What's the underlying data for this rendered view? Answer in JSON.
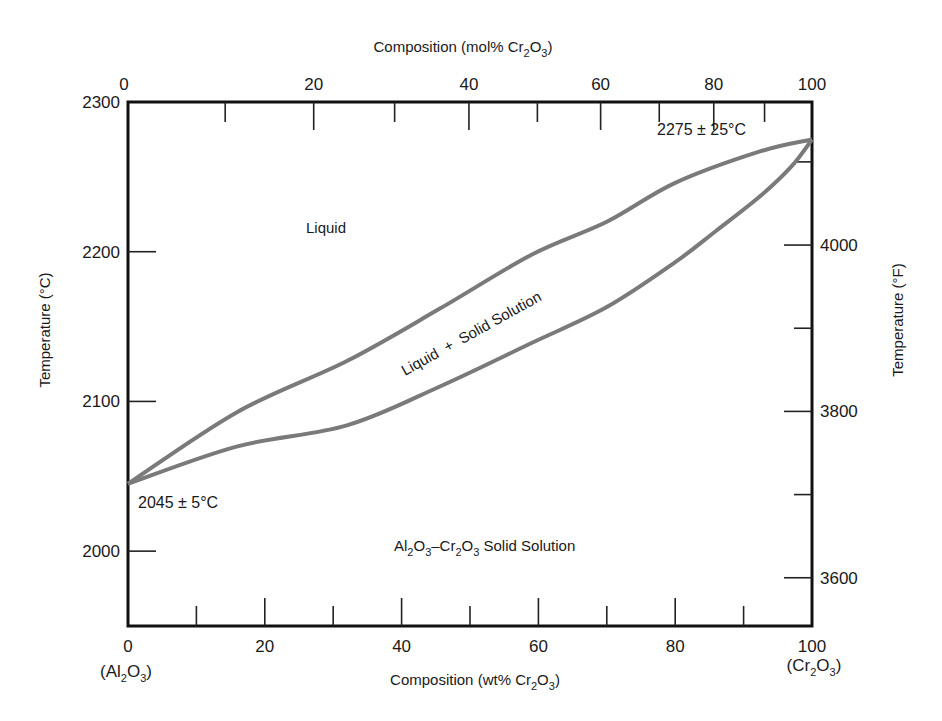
{
  "chart_data": {
    "type": "line",
    "title": "",
    "xlabel": "Composition (wt% Cr2O3)",
    "xlabel_parts": {
      "pre": "Composition (wt% Cr",
      "sub1": "2",
      "mid": "O",
      "sub2": "3",
      "post": ")"
    },
    "x2label": "Composition (mol% Cr2O3)",
    "x2label_parts": {
      "pre": "Composition (mol% Cr",
      "sub1": "2",
      "mid": "O",
      "sub2": "3",
      "post": ")"
    },
    "ylabel": "Temperature (°C)",
    "y2label": "Temperature (°F)",
    "xlim": [
      0,
      100
    ],
    "ylim": [
      1950,
      2300
    ],
    "grid": false,
    "x_ticks": {
      "major": [
        0,
        20,
        40,
        60,
        80,
        100
      ],
      "minor": [
        10,
        30,
        50,
        70,
        90
      ]
    },
    "x_tick_labels": [
      "0",
      "20",
      "40",
      "60",
      "80",
      "100"
    ],
    "x2_ticks_mol": {
      "major": [
        0,
        20,
        40,
        60,
        80,
        100
      ],
      "minor": [
        10,
        30,
        50,
        70,
        90
      ]
    },
    "x2_tick_labels": [
      "0",
      "20",
      "40",
      "60",
      "80",
      "100"
    ],
    "y_ticks": [
      2000,
      2100,
      2200,
      2300
    ],
    "y_tick_labels": [
      "2000",
      "2100",
      "2200",
      "2300"
    ],
    "y2_ticks_F": {
      "major": [
        3600,
        3800,
        4000
      ],
      "minor": [
        3700,
        3900,
        4100
      ]
    },
    "y2_tick_labels": [
      "3600",
      "3800",
      "4000"
    ],
    "endpoint_labels": {
      "left": {
        "pre": "(Al",
        "sub1": "2",
        "mid": "O",
        "sub2": "3",
        "post": ")"
      },
      "right": {
        "pre": "(Cr",
        "sub1": "2",
        "mid": "O",
        "sub2": "3",
        "post": ")"
      }
    },
    "series": [
      {
        "name": "Liquidus",
        "color": "#7a7a7a",
        "x": [
          0,
          16,
          32,
          45.6,
          59,
          70,
          80,
          92.4,
          100
        ],
        "y": [
          2045,
          2093,
          2127,
          2162,
          2198,
          2220,
          2246,
          2267,
          2275
        ]
      },
      {
        "name": "Solidus",
        "color": "#7a7a7a",
        "x": [
          0,
          16,
          32,
          45.6,
          59,
          70,
          80,
          86,
          92.4,
          97,
          100
        ],
        "y": [
          2045,
          2070,
          2084,
          2110,
          2139,
          2163,
          2193,
          2214,
          2237,
          2257,
          2275
        ]
      }
    ],
    "annotations": [
      {
        "text": "2275 ± 25°C",
        "x": 86,
        "y": 2281
      },
      {
        "text": "2045 ± 5°C",
        "x": 7,
        "y": 2030
      },
      {
        "text": "Liquid",
        "x": 30,
        "y": 2218
      },
      {
        "text": "Liquid + Solid Solution",
        "x": 52,
        "y": 2140,
        "rotation": -28
      },
      {
        "text": "Al2O3–Cr2O3 Solid Solution",
        "x": 58,
        "y": 2005
      }
    ],
    "region_labels": {
      "liquid": "Liquid",
      "two_phase": "Liquid  +  Solid Solution",
      "solid": {
        "al": "Al",
        "s1": "2",
        "o1": "O",
        "s2": "3",
        "dash": "–Cr",
        "s3": "2",
        "o2": "O",
        "s4": "3",
        "post": " Solid Solution"
      }
    },
    "annotation_text": {
      "top": "2275 ± 25°C",
      "bottom": "2045 ± 5°C"
    }
  }
}
